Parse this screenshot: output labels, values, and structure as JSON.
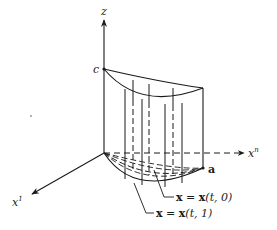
{
  "figure": {
    "type": "3d-surface-sketch",
    "axes": {
      "z": {
        "label": "z"
      },
      "xn": {
        "label_base": "x",
        "label_sup": "n"
      },
      "x1": {
        "label_base": "x",
        "label_sup": "1"
      }
    },
    "points": {
      "c": {
        "label": "c"
      },
      "a": {
        "label": "a"
      }
    },
    "curve_labels": {
      "t0": {
        "lhs": "x",
        "eq": " = ",
        "rhs": "x",
        "args": "(t, 0)"
      },
      "t1": {
        "lhs": "x",
        "eq": " = ",
        "rhs": "x",
        "args": "(t, 1)"
      }
    },
    "colors": {
      "ink": "#1a1a1a",
      "background": "#ffffff"
    }
  }
}
